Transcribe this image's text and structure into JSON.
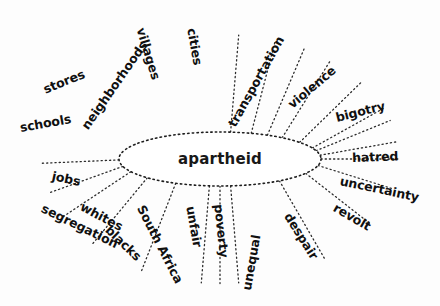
{
  "diagram": {
    "type": "word-web",
    "center": {
      "label": "apartheid",
      "shape": "ellipse",
      "stroke_style": "dotted",
      "cx": 220,
      "cy": 159,
      "rx": 101,
      "ry": 27
    },
    "style": {
      "background": "#fdfdfd",
      "ink": "#101010",
      "line": "#2b2b2b",
      "line_style": "dotted"
    },
    "spokes": [
      {
        "label": "schools",
        "angle_deg": -8,
        "lx": 20,
        "ly": 122,
        "rot": -10,
        "ex": 122,
        "ey": 152
      },
      {
        "label": "stores",
        "angle_deg": -24,
        "lx": 44,
        "ly": 84,
        "rot": -22,
        "ex": 133,
        "ey": 140
      },
      {
        "label": "neighborhoods",
        "angle_deg": -52,
        "lx": 85,
        "ly": 122,
        "rot": -55,
        "ex": 150,
        "ey": 134
      },
      {
        "label": "villages",
        "angle_deg": -72,
        "lx": 140,
        "ly": 22,
        "rot": 73,
        "ex": 172,
        "ey": 130
      },
      {
        "label": "cities",
        "angle_deg": -84,
        "lx": 191,
        "ly": 22,
        "rot": 80,
        "ex": 199,
        "ey": 130
      },
      {
        "label": "transportation",
        "angle_deg": -62,
        "lx": 232,
        "ly": 120,
        "rot": -61,
        "ex": 238,
        "ey": 131
      },
      {
        "label": "violence",
        "angle_deg": -38,
        "lx": 290,
        "ly": 100,
        "rot": -40,
        "ex": 277,
        "ey": 138
      },
      {
        "label": "bigotry",
        "angle_deg": -18,
        "lx": 336,
        "ly": 112,
        "rot": -14,
        "ex": 307,
        "ey": 142
      },
      {
        "label": "hatred",
        "angle_deg": 0,
        "lx": 352,
        "ly": 152,
        "rot": -2,
        "ex": 321,
        "ey": 157
      },
      {
        "label": "uncertainty",
        "angle_deg": 14,
        "lx": 340,
        "ly": 175,
        "rot": 12,
        "ex": 318,
        "ey": 170
      },
      {
        "label": "revolt",
        "angle_deg": 32,
        "lx": 334,
        "ly": 201,
        "rot": 30,
        "ex": 305,
        "ey": 180
      },
      {
        "label": "despair",
        "angle_deg": 54,
        "lx": 287,
        "ly": 208,
        "rot": 58,
        "ex": 281,
        "ey": 182
      },
      {
        "label": "unequal",
        "angle_deg": 84,
        "lx": 247,
        "ly": 284,
        "rot": -80,
        "ex": 243,
        "ey": 187
      },
      {
        "label": "poverty",
        "angle_deg": 90,
        "lx": 218,
        "ly": 198,
        "rot": 84,
        "ex": 218,
        "ey": 188
      },
      {
        "label": "unfair",
        "angle_deg": 96,
        "lx": 190,
        "ly": 200,
        "rot": 80,
        "ex": 196,
        "ey": 187
      },
      {
        "label": "South Africa",
        "angle_deg": 116,
        "lx": 140,
        "ly": 200,
        "rot": 63,
        "ex": 172,
        "ey": 185
      },
      {
        "label": "blacks",
        "angle_deg": 136,
        "lx": 107,
        "ly": 222,
        "rot": 44,
        "ex": 152,
        "ey": 181
      },
      {
        "label": "whites",
        "angle_deg": 152,
        "lx": 81,
        "ly": 200,
        "rot": 28,
        "ex": 138,
        "ey": 176
      },
      {
        "label": "segregation",
        "angle_deg": 164,
        "lx": 42,
        "ly": 202,
        "rot": 26,
        "ex": 127,
        "ey": 170
      },
      {
        "label": "jobs",
        "angle_deg": 178,
        "lx": 52,
        "ly": 170,
        "rot": 12,
        "ex": 121,
        "ey": 165
      }
    ]
  }
}
